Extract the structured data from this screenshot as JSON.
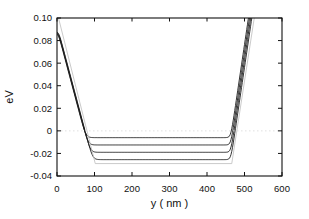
{
  "figure": {
    "background": "#ffffff",
    "axis_color": "#111111",
    "curve_color": "#1c1c1c",
    "reference_color": "#bdbdbd",
    "zero_line_color": "#d9d9d9"
  },
  "chart_data": {
    "type": "line",
    "title": "",
    "xlabel": "y ( nm )",
    "ylabel": "eV",
    "xlim": [
      0,
      600
    ],
    "ylim": [
      -0.04,
      0.1
    ],
    "x_ticks": [
      0,
      100,
      200,
      300,
      400,
      500,
      600
    ],
    "x_tick_labels": [
      "0",
      "100",
      "200",
      "300",
      "400",
      "500",
      "600"
    ],
    "y_ticks": [
      -0.04,
      -0.02,
      0,
      0.02,
      0.04,
      0.06,
      0.08,
      0.1
    ],
    "y_tick_labels": [
      "-0.04",
      "-0.02",
      "0",
      "0.02",
      "0.04",
      "0.06",
      "0.08",
      "0.10"
    ],
    "grid": "none except light dotted horizontal line at 0 eV",
    "legend": "none",
    "series": [
      {
        "name": "band-profile-1",
        "color": "#1c1c1c",
        "style": "solid",
        "plateau_eV": -0.006,
        "model": {
          "plateau": -0.006,
          "v0": 0.0905,
          "slope": 0.00125,
          "cap": 0.0862,
          "kc": 0.003,
          "kp": 0.005,
          "rx": 466,
          "rslope": 0.00225,
          "kr": 0.006
        },
        "points": [
          [
            0,
            0.086
          ],
          [
            25,
            0.059
          ],
          [
            50,
            0.028
          ],
          [
            75,
            -0.001
          ],
          [
            100,
            -0.005
          ],
          [
            200,
            -0.006
          ],
          [
            400,
            -0.006
          ],
          [
            470,
            0.009
          ],
          [
            490,
            0.054
          ],
          [
            510,
            0.1
          ]
        ]
      },
      {
        "name": "band-profile-2",
        "color": "#1c1c1c",
        "style": "solid",
        "plateau_eV": -0.0125,
        "model": {
          "plateau": -0.0125,
          "v0": 0.0915,
          "slope": 0.00125,
          "cap": 0.0868,
          "kc": 0.003,
          "kp": 0.005,
          "rx": 469,
          "rslope": 0.00225,
          "kr": 0.006
        },
        "points": [
          [
            0,
            0.086
          ],
          [
            25,
            0.06
          ],
          [
            50,
            0.029
          ],
          [
            80,
            -0.007
          ],
          [
            110,
            -0.012
          ],
          [
            200,
            -0.0125
          ],
          [
            400,
            -0.0125
          ],
          [
            475,
            0.013
          ],
          [
            495,
            0.058
          ],
          [
            513,
            0.1
          ]
        ]
      },
      {
        "name": "band-profile-3",
        "color": "#1c1c1c",
        "style": "solid",
        "plateau_eV": -0.019,
        "model": {
          "plateau": -0.019,
          "v0": 0.0925,
          "slope": 0.00125,
          "cap": 0.0874,
          "kc": 0.003,
          "kp": 0.005,
          "rx": 472,
          "rslope": 0.00225,
          "kr": 0.006
        },
        "points": [
          [
            0,
            0.087
          ],
          [
            25,
            0.061
          ],
          [
            50,
            0.03
          ],
          [
            85,
            -0.013
          ],
          [
            120,
            -0.019
          ],
          [
            200,
            -0.019
          ],
          [
            400,
            -0.019
          ],
          [
            480,
            0.018
          ],
          [
            500,
            0.063
          ],
          [
            516,
            0.1
          ]
        ]
      },
      {
        "name": "band-profile-4",
        "color": "#1c1c1c",
        "style": "solid",
        "plateau_eV": -0.0255,
        "model": {
          "plateau": -0.0255,
          "v0": 0.0935,
          "slope": 0.00125,
          "cap": 0.088,
          "kc": 0.003,
          "kp": 0.005,
          "rx": 475,
          "rslope": 0.00225,
          "kr": 0.006
        },
        "points": [
          [
            0,
            0.087
          ],
          [
            25,
            0.062
          ],
          [
            50,
            0.031
          ],
          [
            90,
            -0.02
          ],
          [
            130,
            -0.0255
          ],
          [
            200,
            -0.0255
          ],
          [
            400,
            -0.0255
          ],
          [
            485,
            0.023
          ],
          [
            505,
            0.068
          ],
          [
            519,
            0.1
          ]
        ]
      },
      {
        "name": "reference-trapezoid-potential",
        "color": "#bdbdbd",
        "style": "solid-thin",
        "shape": "piecewise-linear",
        "points": [
          [
            4,
            0.1
          ],
          [
            102,
            -0.029
          ],
          [
            466,
            -0.029
          ],
          [
            526,
            0.1
          ]
        ]
      },
      {
        "name": "zero-level-line",
        "color": "#d9d9d9",
        "style": "dotted",
        "shape": "piecewise-linear",
        "points": [
          [
            0,
            0
          ],
          [
            600,
            0
          ]
        ]
      }
    ]
  }
}
